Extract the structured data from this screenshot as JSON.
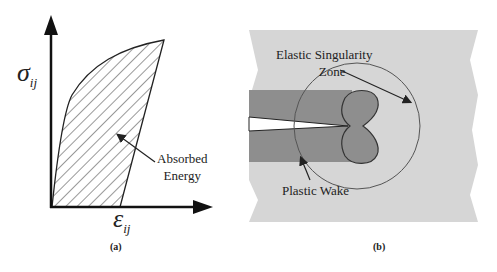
{
  "panel_a": {
    "caption": "(a)",
    "y_axis_label": "σ",
    "y_axis_subscript": "ij",
    "x_axis_label": "ε",
    "x_axis_subscript": "ij",
    "annotation_line1": "Absorbed",
    "annotation_line2": "Energy"
  },
  "panel_b": {
    "caption": "(b)",
    "elastic_zone_line1": "Elastic Singularity",
    "elastic_zone_line2": "Zone",
    "plastic_wake_label": "Plastic Wake",
    "colors": {
      "background": "#d6d6d6",
      "wake": "#8e8e8e",
      "outline": "#444444"
    }
  }
}
